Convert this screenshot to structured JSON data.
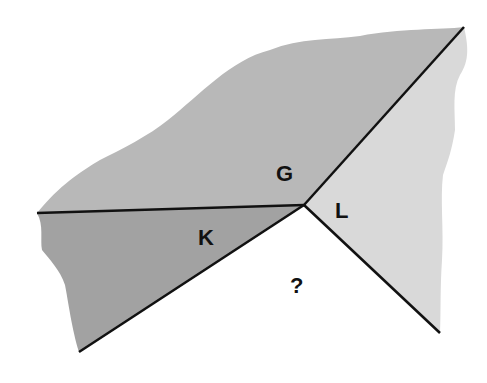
{
  "diagram": {
    "vertex": {
      "x": 304,
      "y": 205
    },
    "colors": {
      "background": "#ffffff",
      "region_g": "#b8b8b8",
      "region_k": "#a2a2a2",
      "region_l": "#d9d9d9",
      "region_unknown": "#ffffff",
      "line": "#111111"
    },
    "labels": {
      "g": "G",
      "k": "K",
      "l": "L",
      "unknown": "?"
    },
    "rays": [
      {
        "name": "left",
        "end": {
          "x": 37,
          "y": 213
        }
      },
      {
        "name": "upper-right",
        "end": {
          "x": 464,
          "y": 27
        }
      },
      {
        "name": "lower-left",
        "end": {
          "x": 79,
          "y": 352
        }
      },
      {
        "name": "lower-right",
        "end": {
          "x": 440,
          "y": 333
        }
      }
    ]
  }
}
